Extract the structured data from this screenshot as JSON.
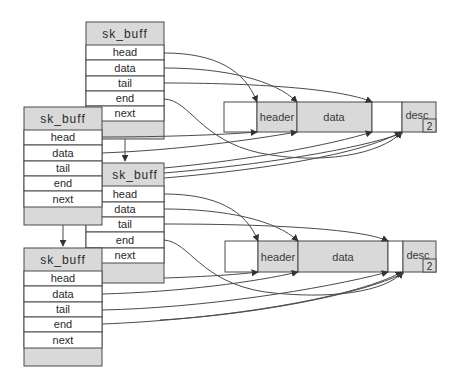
{
  "diagram": {
    "type": "linked sk_buff structures pointing into shared data buffers",
    "colors": {
      "line": "#4a4a4a",
      "grey_fill": "#d9d9d9",
      "white_fill": "#ffffff"
    },
    "sk_buffs": [
      {
        "id": "skb1",
        "title": "sk_buff",
        "fields": [
          "head",
          "data",
          "tail",
          "end",
          "next"
        ]
      },
      {
        "id": "skb2",
        "title": "sk_buff",
        "fields": [
          "head",
          "data",
          "tail",
          "end",
          "next"
        ]
      },
      {
        "id": "skb3",
        "title": "sk_buff",
        "fields": [
          "head",
          "data",
          "tail",
          "end",
          "next"
        ]
      },
      {
        "id": "skb4",
        "title": "sk_buff",
        "fields": [
          "head",
          "data",
          "tail",
          "end",
          "next"
        ]
      }
    ],
    "buffers": [
      {
        "id": "buf1",
        "segments": [
          "",
          "header",
          "data",
          "",
          "desc"
        ],
        "badge": "2"
      },
      {
        "id": "buf2",
        "segments": [
          "",
          "header",
          "data",
          "",
          "desc"
        ],
        "badge": "2"
      }
    ],
    "pointers": [
      {
        "from": "skb1.head",
        "to": "buf1.header-start"
      },
      {
        "from": "skb1.data",
        "to": "buf1.data-start"
      },
      {
        "from": "skb1.tail",
        "to": "buf1.data-end"
      },
      {
        "from": "skb1.end",
        "to": "buf1.desc-start"
      },
      {
        "from": "skb1.next",
        "to": "skb2"
      },
      {
        "from": "skb2.head",
        "to": "buf1.header-start"
      },
      {
        "from": "skb2.data",
        "to": "buf1.data-start"
      },
      {
        "from": "skb2.tail",
        "to": "buf1.data-end"
      },
      {
        "from": "skb2.end",
        "to": "buf1.desc-start"
      },
      {
        "from": "skb2.next",
        "to": "skb4"
      },
      {
        "from": "skb3.head",
        "to": "buf2.header-start"
      },
      {
        "from": "skb3.data",
        "to": "buf2.data-start"
      },
      {
        "from": "skb3.tail",
        "to": "buf2.data-end"
      },
      {
        "from": "skb3.end",
        "to": "buf2.desc-start"
      },
      {
        "from": "skb4.head",
        "to": "buf2.header-start"
      },
      {
        "from": "skb4.data",
        "to": "buf2.data-start"
      },
      {
        "from": "skb4.tail",
        "to": "buf2.data-end"
      },
      {
        "from": "skb4.end",
        "to": "buf2.desc-start"
      }
    ]
  }
}
